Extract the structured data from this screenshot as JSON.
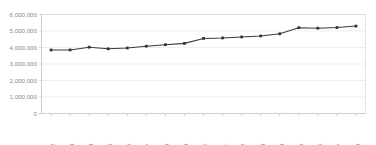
{
  "chart_data": {
    "type": "line",
    "title": "",
    "subtitle": "",
    "xlabel": "",
    "ylabel": "",
    "categories": [
      "2002",
      "2003",
      "2004",
      "2005",
      "2006",
      "2007",
      "2008",
      "2009",
      "2010",
      "2011",
      "2012",
      "2013",
      "2014",
      "2015",
      "2016",
      "2017",
      "2018"
    ],
    "series": [
      {
        "name": "",
        "values": [
          3850000,
          3850000,
          4020000,
          3920000,
          3970000,
          4080000,
          4170000,
          4250000,
          4550000,
          4580000,
          4640000,
          4700000,
          4830000,
          5200000,
          5170000,
          5210000,
          5300000
        ]
      }
    ],
    "ylim": [
      0,
      6000000
    ],
    "y_ticks": [
      0,
      1000000,
      2000000,
      3000000,
      4000000,
      5000000,
      6000000
    ],
    "y_tick_labels": [
      "0",
      "1,000,000",
      "2,000,000",
      "3,000,000",
      "4,000,000",
      "5,000,000",
      "6,000,000"
    ],
    "x_tick_labels": [
      "2002",
      "2003",
      "2004",
      "2005",
      "2006",
      "2007",
      "2008",
      "2009",
      "2010",
      "2011",
      "2012",
      "2013",
      "2014",
      "2015",
      "2016",
      "2017",
      "2018"
    ],
    "grid": true,
    "grid_axis": "y",
    "legend": false,
    "legend_position": "none",
    "markers": true,
    "x_tick_rotation": -90,
    "colors": {
      "line": "#3a3a3a",
      "marker": "#2e2e2e",
      "gridline": "#e3e3e3",
      "axis": "#c4c4c4",
      "tick_label": "#8b8b8b",
      "background": "#ffffff",
      "plot_border": "#d7d7d7"
    }
  }
}
